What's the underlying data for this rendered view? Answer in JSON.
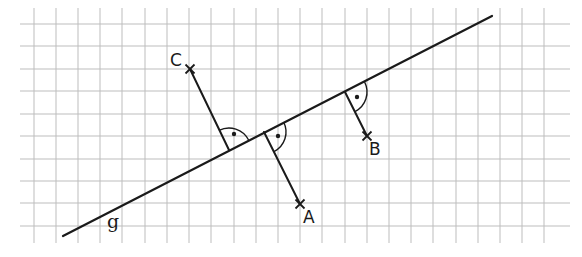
{
  "diagram": {
    "type": "geometry-construction",
    "colors": {
      "background": "#ffffff",
      "grid": "#bdbdbd",
      "ink": "#1a1a1a"
    },
    "grid": {
      "x_start": 20,
      "x_end": 570,
      "y_start": 8,
      "y_end": 243,
      "vertical_lines": [
        34,
        56,
        78,
        100,
        122,
        145,
        167,
        189,
        211,
        234,
        256,
        278,
        300,
        322,
        345,
        367,
        389,
        411,
        433,
        456,
        478,
        500,
        522,
        544
      ],
      "horizontal_lines": [
        24,
        46,
        69,
        91,
        114,
        136,
        159,
        181,
        203,
        226
      ]
    },
    "line_g": {
      "label": "g",
      "x1": 63,
      "y1": 236,
      "x2": 492,
      "y2": 16,
      "label_x": 107,
      "label_y": 228
    },
    "points": [
      {
        "name": "C",
        "label": "C",
        "x": 190,
        "y": 69,
        "foot_x": 229,
        "foot_y": 150,
        "label_x": 170,
        "label_y": 66,
        "arc": "M 219 130.4 A 22 22 0 0 1 248.6 140",
        "dot_x": 234,
        "dot_y": 134
      },
      {
        "name": "A",
        "label": "A",
        "x": 300,
        "y": 204,
        "foot_x": 264,
        "foot_y": 132,
        "label_x": 303,
        "label_y": 223,
        "arc": "M 283.6 122 A 22 22 0 0 1 274 151.6",
        "dot_x": 278,
        "dot_y": 136
      },
      {
        "name": "B",
        "label": "B",
        "x": 367,
        "y": 136,
        "foot_x": 345,
        "foot_y": 92,
        "label_x": 369,
        "label_y": 155,
        "arc": "M 364.6 82 A 22 22 0 0 1 355 111.6",
        "dot_x": 357,
        "dot_y": 97
      }
    ]
  }
}
